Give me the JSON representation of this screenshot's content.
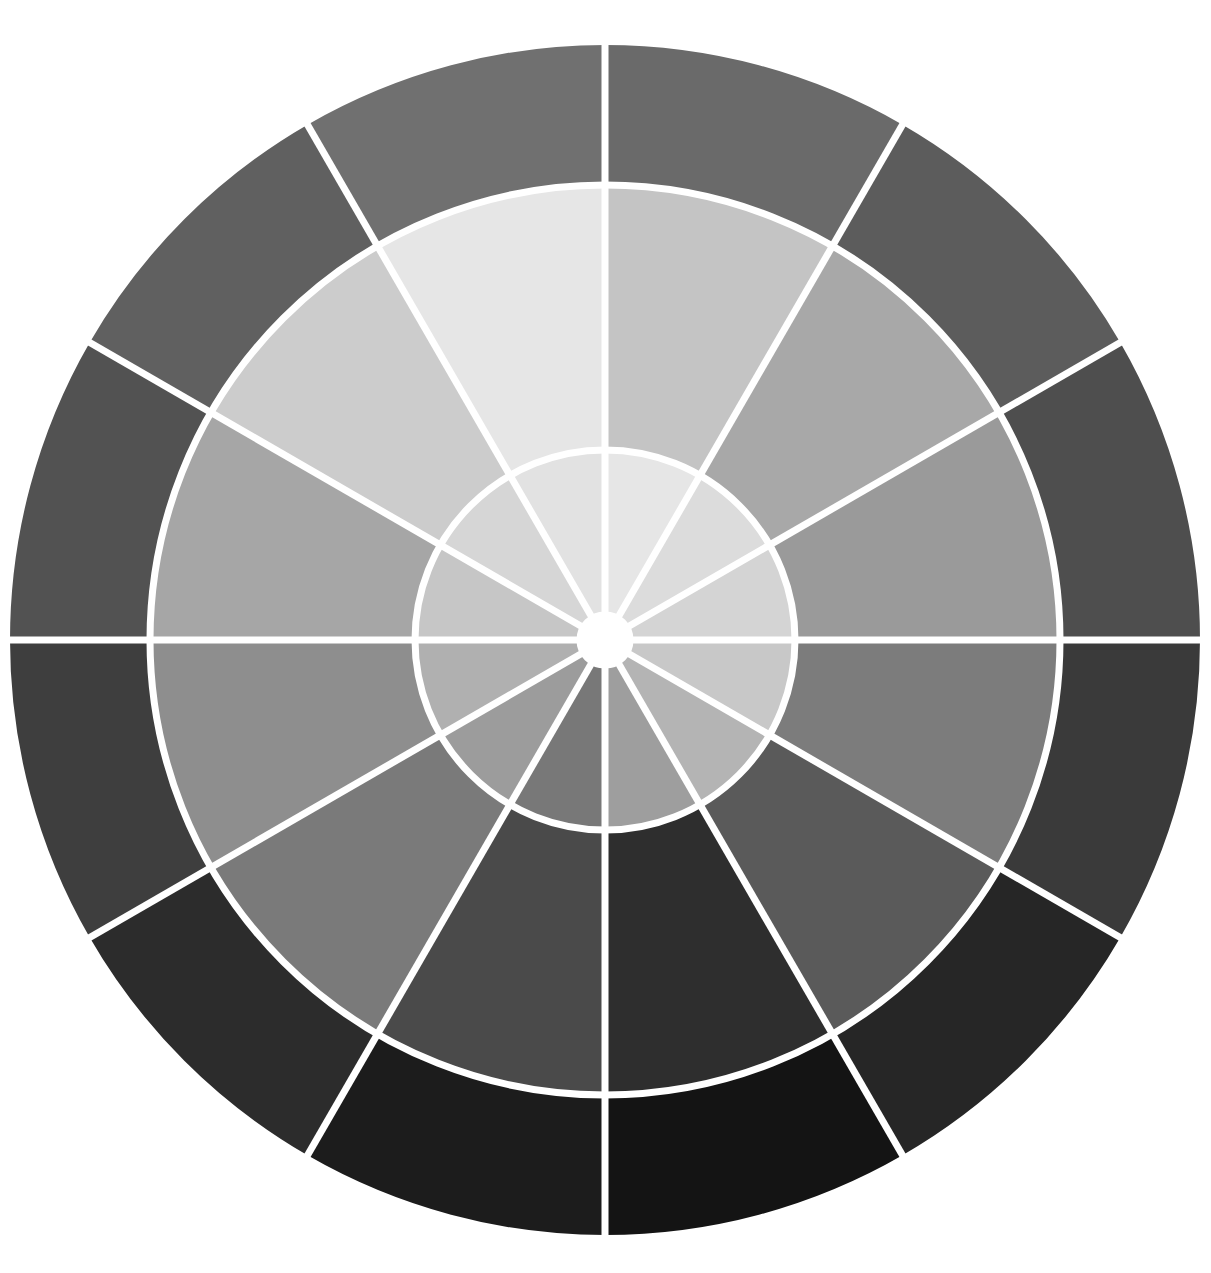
{
  "diagram": {
    "type": "grayscale-value-wheel",
    "segments": 12,
    "center": [
      605,
      640
    ],
    "divider_color": "#ffffff",
    "divider_width": 7,
    "center_dot_radius": 25,
    "rings": [
      {
        "name": "inner-ring",
        "r_inner": 25,
        "r_outer": 190,
        "colors": [
          "#e6e6e6",
          "#dcdcdc",
          "#d4d4d4",
          "#c8c8c8",
          "#b4b4b4",
          "#9e9e9e",
          "#787878",
          "#9c9c9c",
          "#b0b0b0",
          "#c6c6c6",
          "#d6d6d6",
          "#e2e2e2"
        ]
      },
      {
        "name": "middle-ring",
        "r_inner": 190,
        "r_outer": 455,
        "colors": [
          "#c4c4c4",
          "#a8a8a8",
          "#9a9a9a",
          "#7c7c7c",
          "#5a5a5a",
          "#2e2e2e",
          "#4a4a4a",
          "#7a7a7a",
          "#8e8e8e",
          "#a6a6a6",
          "#cccccc",
          "#e6e6e6"
        ]
      },
      {
        "name": "outer-ring",
        "r_inner": 455,
        "r_outer": 595,
        "colors": [
          "#6a6a6a",
          "#5c5c5c",
          "#4e4e4e",
          "#3a3a3a",
          "#262626",
          "#141414",
          "#1c1c1c",
          "#2c2c2c",
          "#3e3e3e",
          "#525252",
          "#606060",
          "#707070"
        ]
      }
    ]
  }
}
